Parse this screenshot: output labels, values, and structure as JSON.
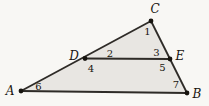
{
  "figure": {
    "colors": {
      "background": "#f8f7f4",
      "triangle_fill": "#e8e6e2",
      "stroke": "#2e2b27",
      "dot": "#17140f",
      "label": "#17140f"
    },
    "stroke_width": 1.8,
    "dot_radius": 2.4,
    "points": {
      "A": {
        "x": 21,
        "y": 91
      },
      "B": {
        "x": 187,
        "y": 93
      },
      "C": {
        "x": 151,
        "y": 21
      },
      "D": {
        "x": 85,
        "y": 58.5
      },
      "E": {
        "x": 170,
        "y": 59
      }
    },
    "outline": [
      "A",
      "C",
      "B"
    ],
    "segments": [
      {
        "name": "segment-AB",
        "from": "A",
        "to": "B"
      },
      {
        "name": "segment-AC",
        "from": "A",
        "to": "C"
      },
      {
        "name": "segment-CB",
        "from": "C",
        "to": "B"
      },
      {
        "name": "segment-DE",
        "from": "D",
        "to": "E"
      }
    ],
    "dots": [
      "A",
      "B",
      "C",
      "D",
      "E"
    ],
    "vertex_labels": [
      {
        "text": "A",
        "x": 10,
        "y": 95,
        "anchor": "middle"
      },
      {
        "text": "B",
        "x": 197,
        "y": 98,
        "anchor": "middle"
      },
      {
        "text": "C",
        "x": 155,
        "y": 12.5,
        "anchor": "middle"
      },
      {
        "text": "D",
        "x": 74,
        "y": 60,
        "anchor": "middle"
      },
      {
        "text": "E",
        "x": 180,
        "y": 60,
        "anchor": "middle"
      }
    ],
    "angle_labels": [
      {
        "text": "1",
        "x": 147.5,
        "y": 35
      },
      {
        "text": "2",
        "x": 110,
        "y": 56.5
      },
      {
        "text": "3",
        "x": 156.5,
        "y": 56
      },
      {
        "text": "4",
        "x": 91,
        "y": 71.5
      },
      {
        "text": "5",
        "x": 162.5,
        "y": 70.5
      },
      {
        "text": "6",
        "x": 38.5,
        "y": 90
      },
      {
        "text": "7",
        "x": 176,
        "y": 88
      }
    ]
  }
}
